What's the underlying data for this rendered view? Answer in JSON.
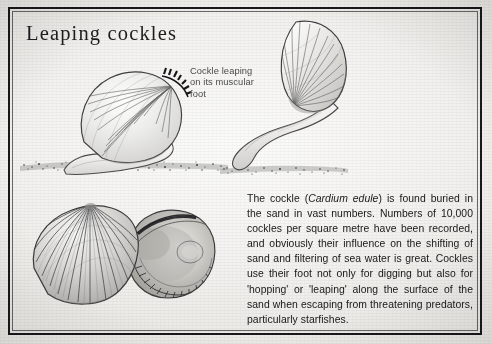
{
  "page": {
    "title": "Leaping cockles",
    "background_color": "#f2f1ef",
    "border_color": "#18181a",
    "ink_color": "#171718"
  },
  "caption": {
    "line1": "Cockle leaping",
    "line2": "on its muscular",
    "line3": "foot"
  },
  "body": {
    "line1_a": "The cockle (",
    "species": "Cardium edule",
    "line1_b": ") is found",
    "line2": "buried in the sand in vast numbers.",
    "line3": "Numbers of 10,000 cockles per square",
    "line4": "metre have been recorded, and obviously",
    "line5": "their influence on the shifting of sand and",
    "line6": "filtering of sea water is great. Cockles use",
    "line7": "their foot not only for digging but also for",
    "line8": "'hopping' or 'leaping' along the surface of",
    "line9": "the sand when escaping from threatening",
    "line10": "predators, particularly starfishes."
  },
  "illustrations": {
    "standing_cockle": "cockle resting upright on sand with muscular foot extended",
    "leaping_cockle": "cockle tilted back mid-leap on a long extended foot",
    "shell_pair": "two cockle shells, ribbed exterior valve and crenulated interior valve"
  }
}
